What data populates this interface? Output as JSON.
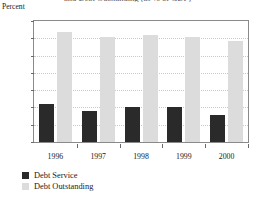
{
  "chart_data": {
    "type": "bar",
    "title": "and Debt Outstanding (as % of GDP)",
    "subtitle": "",
    "xlabel": "",
    "ylabel": "Percent",
    "ylim": [
      0,
      70
    ],
    "ytick_values": [
      0,
      10,
      20,
      30,
      40,
      50,
      60,
      70
    ],
    "ytick_labels": [
      "0",
      "10",
      "20",
      "30",
      "40",
      "50",
      "60",
      "70"
    ],
    "categories": [
      "1996",
      "1997",
      "1998",
      "1999",
      "2000"
    ],
    "grid": true,
    "grid_axis": "y",
    "grid_style": "dotted",
    "legend_position": "below-left",
    "series": [
      {
        "name": "Debt Service",
        "color": "#2a2a2a",
        "values": [
          22,
          18,
          20.5,
          20,
          15.5
        ]
      },
      {
        "name": "Debt Outstanding",
        "color": "#dcdcdc",
        "values": [
          63.5,
          61,
          62,
          61,
          58.5
        ]
      }
    ]
  },
  "legend": {
    "items": [
      {
        "label": "Debt Service",
        "swatch": "dark"
      },
      {
        "label": "Debt Outstanding",
        "swatch": "light"
      }
    ]
  }
}
